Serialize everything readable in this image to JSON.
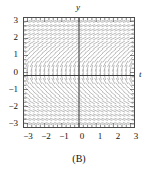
{
  "figure": {
    "caption": "(B)",
    "x_axis_letter": "t",
    "y_axis_letter": "y"
  },
  "chart_data": {
    "type": "scatter",
    "subtype": "slope-field",
    "title": "(B)",
    "xlabel": "t",
    "ylabel": "y",
    "xlim": [
      -3.2,
      3.2
    ],
    "ylim": [
      -3.2,
      3.2
    ],
    "grid": false,
    "legend": null,
    "xticks": [
      -3,
      -2,
      -1,
      0,
      1,
      2,
      3
    ],
    "xtick_labels": [
      "−3",
      "−2",
      "−1",
      "0",
      "1",
      "2",
      "3"
    ],
    "yticks": [
      -3,
      -2,
      -1,
      0,
      1,
      2,
      3
    ],
    "ytick_labels": [
      "−3",
      "−2",
      "−1",
      "0",
      "1",
      "2",
      "3"
    ],
    "minor_tick_step": 0.25,
    "axes_through_origin": true,
    "field": {
      "description": "Direction field: segment slope depends only on y; nearly vertical for |y| large, flattening to horizontal as y approaches 0",
      "slope_rule": "dy/dt = 1/y",
      "grid_t_min": -3.0,
      "grid_t_max": 3.0,
      "grid_t_step": 0.25,
      "grid_y_min": -3.0,
      "grid_y_max": 3.0,
      "grid_y_step": 0.25,
      "segment_length": 0.2,
      "color": "#a8a8a8",
      "sample_slopes": [
        {
          "y": 3.0,
          "slope": 0.333
        },
        {
          "y": 2.0,
          "slope": 0.5
        },
        {
          "y": 1.0,
          "slope": 1.0
        },
        {
          "y": 0.5,
          "slope": 2.0
        },
        {
          "y": 0.25,
          "slope": 4.0
        },
        {
          "y": -0.25,
          "slope": -4.0
        },
        {
          "y": -0.5,
          "slope": -2.0
        },
        {
          "y": -1.0,
          "slope": -1.0
        },
        {
          "y": -2.0,
          "slope": -0.5
        },
        {
          "y": -3.0,
          "slope": -0.333
        }
      ]
    },
    "colors": {
      "field": "#a8a8a8",
      "axis": "#3a3a3a",
      "frame": "#4a4a4a",
      "text": "#111111",
      "background": "#ffffff"
    }
  },
  "y_tick_labels": [
    {
      "text": "3",
      "top": 16
    },
    {
      "text": "2",
      "top": 33
    },
    {
      "text": "1",
      "top": 50
    },
    {
      "text": "0",
      "top": 68
    },
    {
      "text": "−1",
      "top": 85
    },
    {
      "text": "−2",
      "top": 102
    },
    {
      "text": "−3",
      "top": 119
    }
  ],
  "x_tick_labels": [
    {
      "text": "−3",
      "left": 21
    },
    {
      "text": "−2",
      "left": 39
    },
    {
      "text": "−1",
      "left": 57
    },
    {
      "text": "0",
      "left": 75
    },
    {
      "text": "1",
      "left": 93
    },
    {
      "text": "2",
      "left": 111
    },
    {
      "text": "3",
      "left": 129
    }
  ]
}
